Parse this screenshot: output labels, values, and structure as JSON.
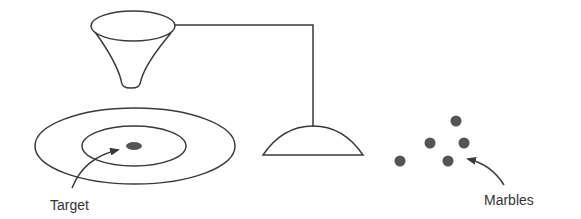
{
  "diagram": {
    "labels": {
      "target": "Target",
      "marbles": "Marbles"
    },
    "elements": [
      "funnel",
      "connecting-rod",
      "dome-base",
      "target-rings",
      "target-center",
      "marbles"
    ],
    "marble_count": 5,
    "colors": {
      "line": "#3a3a3a",
      "marble": "#555555",
      "target_center": "#555555",
      "background": "#ffffff"
    }
  }
}
